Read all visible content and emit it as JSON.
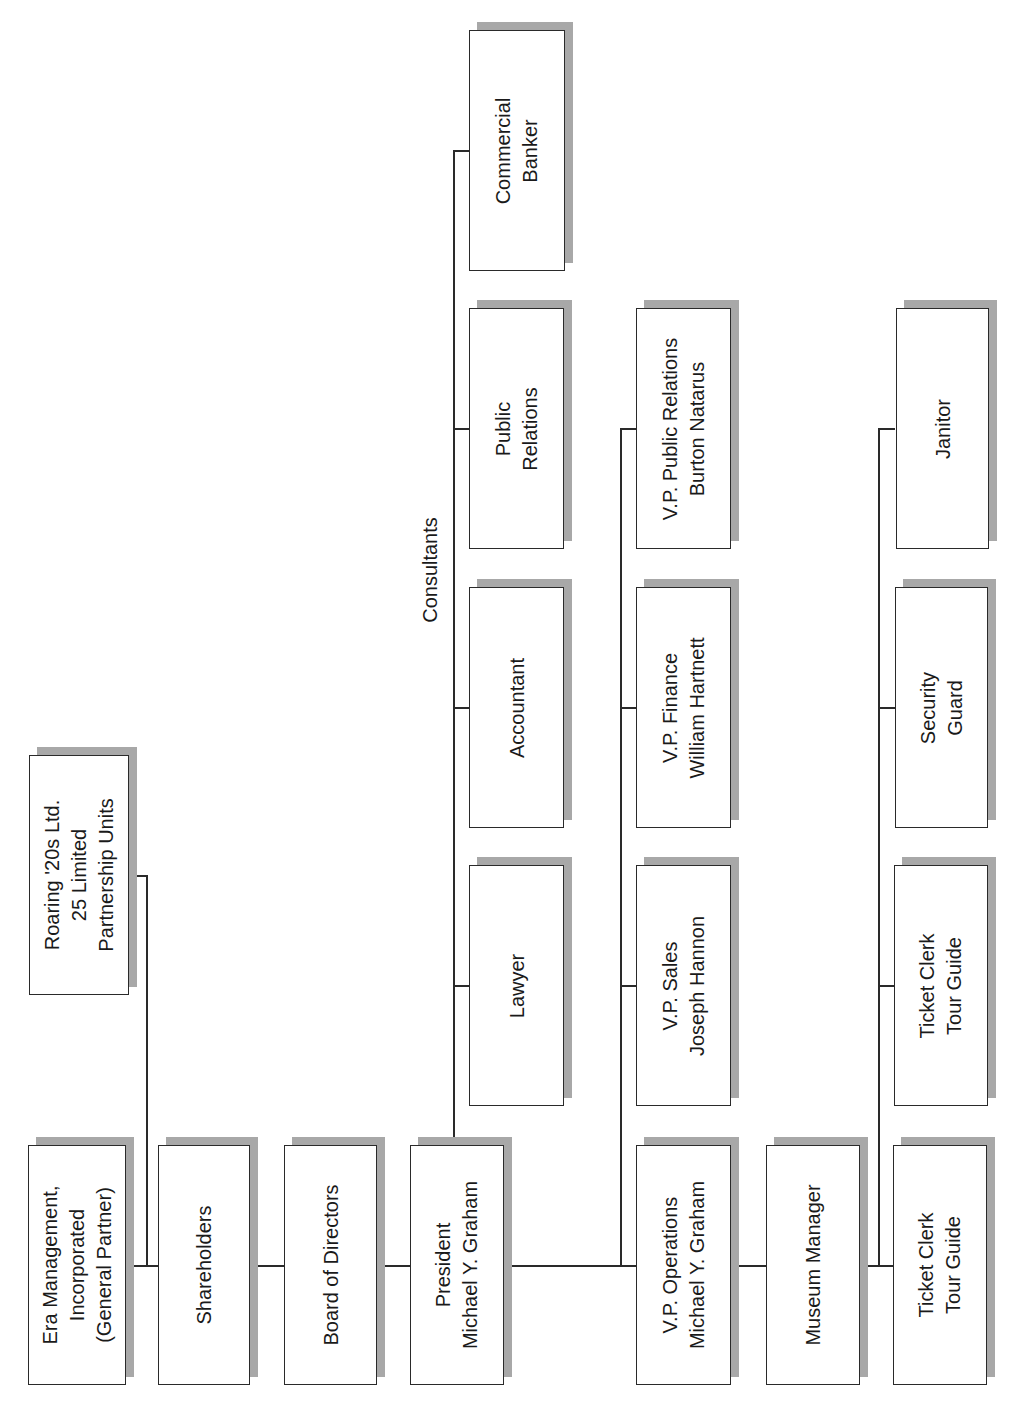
{
  "diagram": {
    "type": "org-chart",
    "orientation": "rotated-90-ccw",
    "colors": {
      "box_border": "#2a2a2a",
      "box_fill": "#ffffff",
      "shadow": "#a8a8a8",
      "line": "#2a2a2a",
      "text": "#1a1a1a"
    },
    "main_chain": [
      {
        "id": "era",
        "label": "Era Management,\nIncorporated\n(General Partner)"
      },
      {
        "id": "shareholders",
        "label": "Shareholders"
      },
      {
        "id": "board",
        "label": "Board of Directors"
      },
      {
        "id": "president",
        "label": "President\nMichael Y. Graham"
      },
      {
        "id": "vp_ops",
        "label": "V.P. Operations\nMichael Y. Graham"
      },
      {
        "id": "museum_manager",
        "label": "Museum Manager"
      },
      {
        "id": "ticket_clerk_1",
        "label": "Ticket Clerk\nTour Guide"
      }
    ],
    "limited_partner": {
      "id": "roaring20s",
      "label": "Roaring '20s Ltd.\n25 Limited\nPartnership Units"
    },
    "consultants": {
      "group_label": "Consultants",
      "items": [
        {
          "id": "lawyer",
          "label": "Lawyer"
        },
        {
          "id": "accountant",
          "label": "Accountant"
        },
        {
          "id": "public_relations",
          "label": "Public\nRelations"
        },
        {
          "id": "commercial_banker",
          "label": "Commercial\nBanker"
        }
      ]
    },
    "vice_presidents": [
      {
        "id": "vp_sales",
        "label": "V.P. Sales\nJoseph Hannon"
      },
      {
        "id": "vp_finance",
        "label": "V.P. Finance\nWilliam Hartnett"
      },
      {
        "id": "vp_pr",
        "label": "V.P. Public Relations\nBurton Natarus"
      }
    ],
    "staff": [
      {
        "id": "ticket_clerk_2",
        "label": "Ticket Clerk\nTour Guide"
      },
      {
        "id": "security_guard",
        "label": "Security\nGuard"
      },
      {
        "id": "janitor",
        "label": "Janitor"
      }
    ]
  }
}
